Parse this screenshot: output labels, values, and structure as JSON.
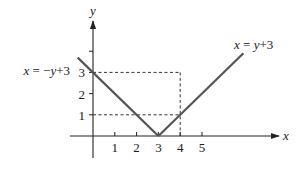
{
  "chart_data": {
    "type": "line",
    "title": "",
    "xlabel": "x",
    "ylabel": "y",
    "xlim": [
      -0.7,
      8.5
    ],
    "ylim": [
      -1,
      5.5
    ],
    "x_ticks": [
      1,
      2,
      3,
      4,
      5
    ],
    "y_ticks": [
      1,
      2,
      3,
      4
    ],
    "x_tick_labels": [
      "1",
      "2",
      "3",
      "4",
      "5"
    ],
    "y_tick_labels": [
      "1",
      "2",
      "3",
      ""
    ],
    "grid": false,
    "series": [
      {
        "name": "x = -y+3",
        "points": [
          [
            -0.7,
            3.7
          ],
          [
            3,
            0
          ]
        ]
      },
      {
        "name": "x = y+3",
        "points": [
          [
            3,
            0
          ],
          [
            6.9,
            3.9
          ]
        ]
      }
    ],
    "annotations": [
      {
        "text": "x = −y+3",
        "anchor": "left-line-top"
      },
      {
        "text": "x = y+3",
        "anchor": "right-line-top"
      }
    ],
    "guides": [
      {
        "type": "dashed",
        "from": [
          0,
          3
        ],
        "to": [
          4,
          3
        ]
      },
      {
        "type": "dashed",
        "from": [
          4,
          3
        ],
        "to": [
          4,
          0
        ]
      },
      {
        "type": "dashed",
        "from": [
          0,
          1
        ],
        "to": [
          4,
          1
        ]
      }
    ]
  }
}
